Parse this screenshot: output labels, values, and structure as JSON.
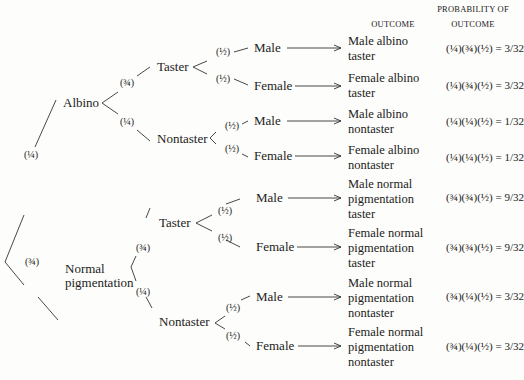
{
  "headers": {
    "outcome": "OUTCOME",
    "probability_line1": "PROBABILITY OF",
    "probability_line2": "OUTCOME"
  },
  "level1": {
    "albino": {
      "label": "Albino",
      "prob": "(¼)"
    },
    "normal": {
      "label_line1": "Normal",
      "label_line2": "pigmentation",
      "prob": "(¾)"
    }
  },
  "level2": {
    "albino_taster": {
      "label": "Taster",
      "prob": "(¾)"
    },
    "albino_nontaster": {
      "label": "Nontaster",
      "prob": "(¼)"
    },
    "normal_taster": {
      "label": "Taster",
      "prob": "(¾)"
    },
    "normal_nontaster": {
      "label": "Nontaster",
      "prob": "(¼)"
    }
  },
  "level3": [
    {
      "label": "Male",
      "prob": "(½)"
    },
    {
      "label": "Female",
      "prob": "(½)"
    },
    {
      "label": "Male",
      "prob": "(½)"
    },
    {
      "label": "Female",
      "prob": "(½)"
    },
    {
      "label": "Male",
      "prob": "(½)"
    },
    {
      "label": "Female",
      "prob": "(½)"
    },
    {
      "label": "Male",
      "prob": "(½)"
    },
    {
      "label": "Female",
      "prob": "(½)"
    }
  ],
  "outcomes": [
    {
      "lines": [
        "Male albino",
        "taster"
      ],
      "probability": "(¼)(¾)(½) = 3/32"
    },
    {
      "lines": [
        "Female albino",
        "taster"
      ],
      "probability": "(¼)(¾)(½) = 3/32"
    },
    {
      "lines": [
        "Male albino",
        "nontaster"
      ],
      "probability": "(¼)(¼)(½) = 1/32"
    },
    {
      "lines": [
        "Female albino",
        "nontaster"
      ],
      "probability": "(¼)(¼)(½) = 1/32"
    },
    {
      "lines": [
        "Male normal",
        "pigmentation",
        "taster"
      ],
      "probability": "(¾)(¾)(½) = 9/32"
    },
    {
      "lines": [
        "Female normal",
        "pigmentation",
        "taster"
      ],
      "probability": "(¾)(¾)(½) = 9/32"
    },
    {
      "lines": [
        "Male normal",
        "pigmentation",
        "nontaster"
      ],
      "probability": "(¾)(¼)(½) = 3/32"
    },
    {
      "lines": [
        "Female normal",
        "pigmentation",
        "nontaster"
      ],
      "probability": "(¾)(¼)(½) = 3/32"
    }
  ]
}
